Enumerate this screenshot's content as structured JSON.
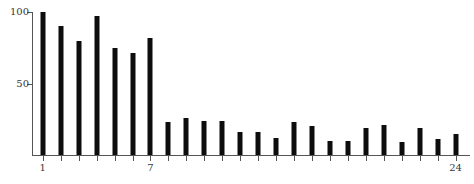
{
  "chart_data": {
    "type": "bar",
    "title": "",
    "xlabel": "",
    "ylabel": "",
    "categories": [
      1,
      2,
      3,
      4,
      5,
      6,
      7,
      8,
      9,
      10,
      11,
      12,
      13,
      14,
      15,
      16,
      17,
      18,
      19,
      20,
      21,
      22,
      23,
      24
    ],
    "values": [
      100,
      90,
      80,
      97,
      75,
      71,
      82,
      23,
      26,
      24,
      24,
      16,
      16,
      12,
      23,
      20,
      10,
      10,
      19,
      21,
      9,
      19,
      11,
      15
    ],
    "ylim": [
      0,
      100
    ],
    "xlim": [
      0.4,
      24.8
    ],
    "y_ticks": [
      {
        "value": 100,
        "label": "100"
      },
      {
        "value": 50,
        "label": "50"
      }
    ],
    "x_ticks": [
      {
        "value": 1,
        "label": "1"
      },
      {
        "value": 2,
        "label": ""
      },
      {
        "value": 3,
        "label": ""
      },
      {
        "value": 4,
        "label": ""
      },
      {
        "value": 5,
        "label": ""
      },
      {
        "value": 6,
        "label": ""
      },
      {
        "value": 7,
        "label": "7"
      },
      {
        "value": 8,
        "label": ""
      },
      {
        "value": 9,
        "label": ""
      },
      {
        "value": 10,
        "label": ""
      },
      {
        "value": 11,
        "label": ""
      },
      {
        "value": 12,
        "label": ""
      },
      {
        "value": 13,
        "label": ""
      },
      {
        "value": 14,
        "label": ""
      },
      {
        "value": 15,
        "label": ""
      },
      {
        "value": 16,
        "label": ""
      },
      {
        "value": 17,
        "label": ""
      },
      {
        "value": 18,
        "label": ""
      },
      {
        "value": 19,
        "label": ""
      },
      {
        "value": 20,
        "label": ""
      },
      {
        "value": 21,
        "label": ""
      },
      {
        "value": 22,
        "label": ""
      },
      {
        "value": 23,
        "label": ""
      },
      {
        "value": 24,
        "label": "24"
      }
    ],
    "grid": false,
    "legend": null,
    "bar_color": "#0d0d0d",
    "axis_color": "#555555",
    "background_color": "#ffffff"
  }
}
